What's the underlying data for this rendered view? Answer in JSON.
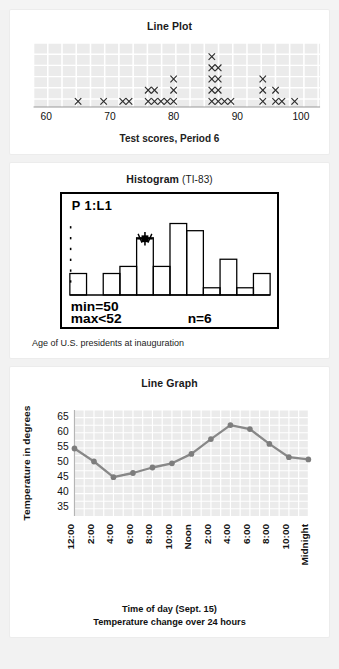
{
  "panels": [
    {
      "id": "line-plot",
      "title": "Line Plot",
      "caption": "Test scores, Period 6"
    },
    {
      "id": "histogram",
      "title": "Histogram",
      "title_sub": "(TI-83)",
      "caption": "Age of U.S. presidents at inauguration",
      "screen_labels": {
        "plot": "P 1:L1",
        "min": "min=50",
        "max": "max<52",
        "n": "n=6"
      }
    },
    {
      "id": "line-graph",
      "title": "Line Graph",
      "xlabel": "Time of day (Sept. 15)",
      "caption": "Temperature change over 24 hours"
    }
  ],
  "chart_data": [
    {
      "type": "scatter",
      "id": "line-plot",
      "title": "Line Plot",
      "xlabel": "Test scores, Period 6",
      "ylabel": "",
      "xlim": [
        58,
        103
      ],
      "xticks": [
        60,
        70,
        80,
        90,
        100
      ],
      "xticklabels": [
        "60",
        "70",
        "80",
        "90",
        "100"
      ],
      "grid": true,
      "marker": "x",
      "note": "Dot plot: each x mark is one observation stacked at its score value.",
      "values": [
        65,
        69,
        72,
        73,
        76,
        76,
        77,
        77,
        79,
        80,
        86,
        86,
        87,
        87,
        88,
        88,
        94,
        94,
        96,
        97,
        99,
        76,
        78,
        79,
        86,
        87,
        94,
        96,
        80,
        86,
        87,
        94,
        87,
        87
      ],
      "stacks": [
        {
          "x": 65,
          "count": 1
        },
        {
          "x": 69,
          "count": 1
        },
        {
          "x": 72,
          "count": 1
        },
        {
          "x": 73,
          "count": 1
        },
        {
          "x": 76,
          "count": 2
        },
        {
          "x": 77,
          "count": 2
        },
        {
          "x": 78,
          "count": 1
        },
        {
          "x": 79,
          "count": 1
        },
        {
          "x": 80,
          "count": 3
        },
        {
          "x": 86,
          "count": 5
        },
        {
          "x": 87,
          "count": 4
        },
        {
          "x": 88,
          "count": 1
        },
        {
          "x": 89,
          "count": 1
        },
        {
          "x": 94,
          "count": 3
        },
        {
          "x": 96,
          "count": 2
        },
        {
          "x": 97,
          "count": 1
        },
        {
          "x": 99,
          "count": 1
        }
      ]
    },
    {
      "type": "bar",
      "id": "histogram",
      "title": "Histogram (TI-83)",
      "xlabel": "Age of U.S. presidents at inauguration",
      "ylabel": "",
      "grid": false,
      "bin_width": 2,
      "bin_start": 42,
      "values": [
        3,
        0,
        3,
        4,
        8,
        4,
        10,
        9,
        1,
        5,
        1,
        3
      ],
      "trace": {
        "min": 50,
        "max": 52,
        "n": 6,
        "bin_index": 4
      },
      "screen_text": [
        "P 1:L1",
        "min=50",
        "max<52",
        "n=6"
      ]
    },
    {
      "type": "line",
      "id": "line-graph",
      "title": "Line Graph",
      "xlabel": "Time of day (Sept. 15)",
      "ylabel": "Temperature in degrees",
      "caption": "Temperature change over 24 hours",
      "ylim": [
        32,
        67
      ],
      "yticks": [
        35,
        40,
        45,
        50,
        55,
        60,
        65
      ],
      "yticklabels": [
        "35",
        "40",
        "45",
        "50",
        "55",
        "60",
        "65"
      ],
      "categories": [
        "12:00",
        "2:00",
        "4:00",
        "6:00",
        "8:00",
        "10:00",
        "Noon",
        "2:00",
        "4:00",
        "6:00",
        "8:00",
        "10:00",
        "Midnight"
      ],
      "values": [
        54.3,
        50.0,
        44.8,
        46.2,
        48.0,
        49.4,
        52.5,
        57.4,
        62.0,
        60.7,
        55.8,
        51.4,
        50.7
      ],
      "grid": true,
      "legend": "none",
      "series_color": "#888888"
    }
  ],
  "colors": {
    "page_background": "#f2f2f2",
    "card_background": "#ffffff",
    "plot_background": "#ebebeb",
    "grid": "#ffffff",
    "ink": "#1a1a1a",
    "line_series": "#8c8c8c",
    "marker": "#7d7d7d"
  }
}
